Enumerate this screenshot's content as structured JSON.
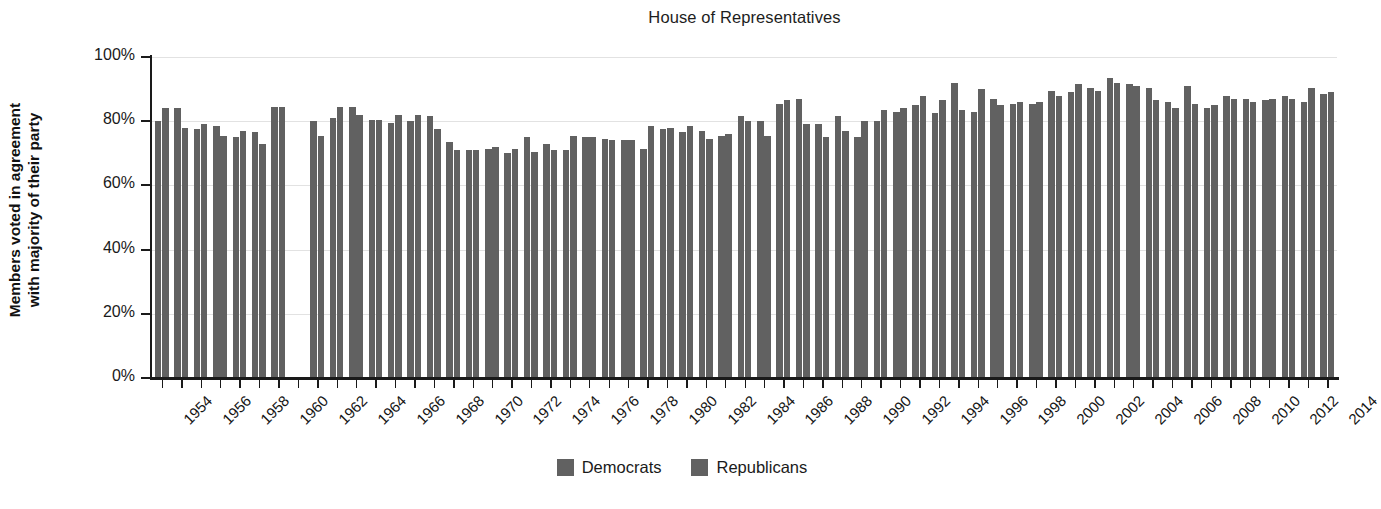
{
  "chart_data": {
    "type": "bar",
    "title": "House of Representatives",
    "xlabel": "",
    "ylabel": "Members voted in agreement with majority of their party",
    "ylabel_line1": "Members voted in agreement",
    "ylabel_line2": "with majority of their party",
    "ylim": [
      0,
      100
    ],
    "yticks": [
      "0%",
      "20%",
      "40%",
      "60%",
      "80%",
      "100%"
    ],
    "ytick_values": [
      0,
      20,
      40,
      60,
      80,
      100
    ],
    "grid": true,
    "legend_position": "bottom",
    "bar_color": "#616161",
    "x": [
      1954,
      1955,
      1956,
      1957,
      1958,
      1959,
      1960,
      1962,
      1963,
      1964,
      1965,
      1966,
      1967,
      1968,
      1969,
      1970,
      1971,
      1972,
      1973,
      1974,
      1975,
      1976,
      1977,
      1978,
      1979,
      1980,
      1981,
      1982,
      1983,
      1984,
      1985,
      1986,
      1987,
      1988,
      1989,
      1990,
      1991,
      1992,
      1993,
      1994,
      1995,
      1996,
      1997,
      1998,
      1999,
      2000,
      2001,
      2002,
      2003,
      2004,
      2005,
      2006,
      2007,
      2008,
      2009,
      2010,
      2011,
      2012,
      2013,
      2014
    ],
    "categories": [
      "1954",
      "1955",
      "1956",
      "1957",
      "1958",
      "1959",
      "1960",
      "1962",
      "1963",
      "1964",
      "1965",
      "1966",
      "1967",
      "1968",
      "1969",
      "1970",
      "1971",
      "1972",
      "1973",
      "1974",
      "1975",
      "1976",
      "1977",
      "1978",
      "1979",
      "1980",
      "1981",
      "1982",
      "1983",
      "1984",
      "1985",
      "1986",
      "1987",
      "1988",
      "1989",
      "1990",
      "1991",
      "1992",
      "1993",
      "1994",
      "1995",
      "1996",
      "1997",
      "1998",
      "1999",
      "2000",
      "2001",
      "2002",
      "2003",
      "2004",
      "2005",
      "2006",
      "2007",
      "2008",
      "2009",
      "2010",
      "2011",
      "2012",
      "2013",
      "2014"
    ],
    "xtick_labels": [
      "1954",
      "1956",
      "1958",
      "1960",
      "1962",
      "1964",
      "1966",
      "1968",
      "1970",
      "1972",
      "1974",
      "1976",
      "1978",
      "1980",
      "1982",
      "1984",
      "1986",
      "1988",
      "1990",
      "1992",
      "1994",
      "1996",
      "1998",
      "2000",
      "2002",
      "2004",
      "2006",
      "2008",
      "2010",
      "2012",
      "2014"
    ],
    "missing_years": [
      1961
    ],
    "series": [
      {
        "name": "Democrats",
        "color": "#616161",
        "values": [
          80,
          84,
          77.5,
          78.5,
          75,
          76.5,
          84.5,
          80,
          81,
          84.5,
          80.5,
          79.5,
          80,
          81.5,
          73.5,
          71,
          71.5,
          70,
          75,
          73,
          71,
          75,
          74.5,
          74,
          71.5,
          77.5,
          76.5,
          77,
          75.5,
          81.5,
          80,
          85.5,
          87,
          79,
          81.5,
          75,
          80,
          83,
          85,
          82.5,
          92,
          83,
          87,
          85.5,
          85.5,
          89.5,
          89,
          90.5,
          93.5,
          91.5,
          90.5,
          86,
          91,
          84,
          88,
          87,
          86.5,
          88,
          86,
          88.5
        ]
      },
      {
        "name": "Republicans",
        "color": "#616161",
        "values": [
          84,
          78,
          79,
          75.5,
          77,
          73,
          84.5,
          75.5,
          84.5,
          82,
          80.5,
          82,
          82,
          77.5,
          71,
          71,
          72,
          71.5,
          70.5,
          71,
          75.5,
          75,
          74,
          74,
          78.5,
          78,
          78.5,
          74.5,
          76,
          80,
          75.5,
          86.5,
          79,
          75,
          77,
          80,
          83.5,
          84,
          88,
          86.5,
          83.5,
          90,
          85,
          86,
          86,
          88,
          91.5,
          89.5,
          92,
          91,
          86.5,
          84,
          85.5,
          85,
          87,
          86,
          87,
          87,
          90.5,
          89
        ]
      }
    ]
  },
  "legend": {
    "items": [
      {
        "label": "Democrats",
        "color": "#616161"
      },
      {
        "label": "Republicans",
        "color": "#616161"
      }
    ]
  }
}
